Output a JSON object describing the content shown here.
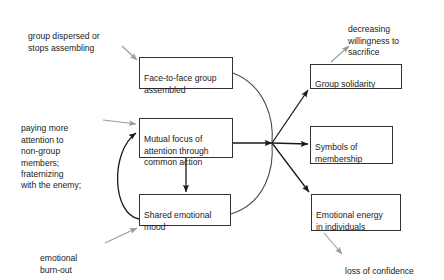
{
  "diagram": {
    "colors": {
      "box_border": "#333333",
      "box_fill": "#ffffff",
      "main_arrow": "#1a1a1a",
      "annotation_arrow": "#9a9a9a",
      "brace": "#4d4d4d",
      "feedback_arrow": "#1a1a1a",
      "text": "#1a1a1a",
      "background": "#ffffff"
    },
    "nodes": [
      {
        "id": "face-to-face",
        "label": "Face-to-face group\nassembled",
        "x": 139,
        "y": 57,
        "w": 94,
        "h": 32
      },
      {
        "id": "mutual-focus",
        "label": "Mutual focus of\nattention through\ncommon action",
        "x": 139,
        "y": 118,
        "w": 94,
        "h": 40
      },
      {
        "id": "shared-mood",
        "label": "Shared emotional\nmood",
        "x": 139,
        "y": 194,
        "w": 92,
        "h": 32
      },
      {
        "id": "group-solidarity",
        "label": "Group solidarity",
        "x": 310,
        "y": 64,
        "w": 92,
        "h": 25
      },
      {
        "id": "symbols-membership",
        "label": "Symbols of\nmembership",
        "x": 310,
        "y": 126,
        "w": 83,
        "h": 38
      },
      {
        "id": "emotional-energy",
        "label": "Emotional energy\nin individuals",
        "x": 311,
        "y": 194,
        "w": 90,
        "h": 37
      }
    ],
    "annotations": [
      {
        "id": "group-dispersed",
        "label": "group dispersed or\nstops assembling",
        "x": 28,
        "y": 20
      },
      {
        "id": "paying-more-attention",
        "label": "paying more\nattention to\nnon-group\nmembers;\nfraternizing\nwith the enemy;",
        "x": 21,
        "y": 112
      },
      {
        "id": "emotional-burn-out",
        "label": "emotional\nburn-out",
        "x": 40,
        "y": 242
      },
      {
        "id": "decreasing-willingness",
        "label": "decreasing\nwillingness to\nsacrifice",
        "x": 348,
        "y": 13
      },
      {
        "id": "loss-of-confidence",
        "label": "loss of confidence",
        "x": 345,
        "y": 255
      }
    ],
    "edges": [
      {
        "id": "dispersed-to-face",
        "kind": "annotation",
        "from": "group-dispersed",
        "to": "face-to-face"
      },
      {
        "id": "paying-to-mutual",
        "kind": "annotation",
        "from": "paying-more-attention",
        "to": "mutual-focus"
      },
      {
        "id": "burnout-to-mood",
        "kind": "annotation",
        "from": "emotional-burn-out",
        "to": "shared-mood"
      },
      {
        "id": "solidarity-to-decreasing",
        "kind": "annotation",
        "from": "group-solidarity",
        "to": "decreasing-willingness"
      },
      {
        "id": "energy-to-loss",
        "kind": "annotation",
        "from": "emotional-energy",
        "to": "loss-of-confidence"
      },
      {
        "id": "mutual-to-mood",
        "kind": "main",
        "from": "mutual-focus",
        "to": "shared-mood"
      },
      {
        "id": "mood-to-mutual-feedback",
        "kind": "feedback",
        "from": "shared-mood",
        "to": "mutual-focus"
      },
      {
        "id": "mutual-to-junction",
        "kind": "main",
        "from": "mutual-focus",
        "to": "junction"
      },
      {
        "id": "junction-to-solidarity",
        "kind": "main",
        "from": "junction",
        "to": "group-solidarity"
      },
      {
        "id": "junction-to-symbols",
        "kind": "main",
        "from": "junction",
        "to": "symbols-membership"
      },
      {
        "id": "junction-to-energy",
        "kind": "main",
        "from": "junction",
        "to": "emotional-energy"
      }
    ],
    "junction": {
      "x": 272,
      "y": 143
    }
  }
}
